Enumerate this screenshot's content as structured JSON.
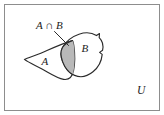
{
  "figure": {
    "kind": "venn-diagram",
    "frame": {
      "border_color": "#8d8d8d",
      "background_color": "#ffffff"
    },
    "colors": {
      "outline": "#2b2b2b",
      "shading": "#b9b9b9",
      "frame": "#8d8d8d",
      "text": "#1c1c1c"
    },
    "labels": {
      "set_a": "A",
      "set_b": "B",
      "intersection": "A ∩ B",
      "universe": "U"
    },
    "regions": [
      {
        "name": "set-a",
        "label": "A",
        "shaded": false
      },
      {
        "name": "set-b",
        "label": "B",
        "shaded": false
      },
      {
        "name": "intersection-a-and-b",
        "label": "A ∩ B",
        "shaded": true,
        "shade_color": "#b9b9b9"
      },
      {
        "name": "universe",
        "label": "U",
        "shaded": false
      }
    ]
  }
}
